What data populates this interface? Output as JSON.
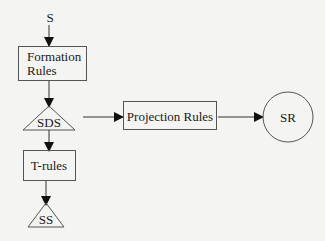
{
  "diagram": {
    "nodes": [
      {
        "id": "S",
        "label": "S",
        "shape": "text"
      },
      {
        "id": "formation",
        "label_line1": "Formation",
        "label_line2": "Rules",
        "shape": "rectangle"
      },
      {
        "id": "SDS",
        "label": "SDS",
        "shape": "triangle"
      },
      {
        "id": "projection",
        "label": "Projection Rules",
        "shape": "rectangle"
      },
      {
        "id": "SR",
        "label": "SR",
        "shape": "circle"
      },
      {
        "id": "trules",
        "label": "T-rules",
        "shape": "rectangle"
      },
      {
        "id": "SS",
        "label": "SS",
        "shape": "triangle"
      }
    ],
    "edges": [
      {
        "from": "S",
        "to": "formation"
      },
      {
        "from": "formation",
        "to": "SDS"
      },
      {
        "from": "SDS",
        "to": "projection"
      },
      {
        "from": "projection",
        "to": "SR"
      },
      {
        "from": "SDS",
        "to": "trules"
      },
      {
        "from": "trules",
        "to": "SS"
      }
    ],
    "colors": {
      "stroke": "#3a3a3a",
      "arrow": "#111111",
      "background": "#f4f4f2"
    }
  }
}
